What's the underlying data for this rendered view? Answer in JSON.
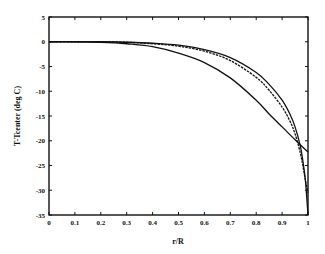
{
  "chart_data": {
    "type": "line",
    "title": "",
    "xlabel": "r/R",
    "ylabel": "T-Tcenter (deg C)",
    "xlim": [
      0,
      1
    ],
    "ylim": [
      -35,
      5
    ],
    "xticks": [
      0,
      0.1,
      0.2,
      0.3,
      0.4,
      0.5,
      0.6,
      0.7,
      0.8,
      0.9,
      1
    ],
    "xtick_labels": [
      "0",
      "0.1",
      "0.2",
      "0.3",
      "0.4",
      "0.5",
      "0.6",
      "0.7",
      "0.8",
      "0.9",
      "1"
    ],
    "yticks": [
      5,
      0,
      -5,
      -10,
      -15,
      -20,
      -25,
      -30,
      -35
    ],
    "ytick_labels": [
      "5",
      "0",
      "-5",
      "-10",
      "-15",
      "-20",
      "-25",
      "-30",
      "-35"
    ],
    "grid": false,
    "legend": null,
    "series": [
      {
        "name": "curve-1-solid-outer",
        "style": "solid",
        "x": [
          0,
          0.1,
          0.2,
          0.3,
          0.4,
          0.5,
          0.6,
          0.7,
          0.8,
          0.85,
          0.9,
          0.93,
          0.95,
          0.97,
          0.98,
          0.99,
          1.0
        ],
        "y": [
          0,
          0,
          0,
          -0.1,
          -0.3,
          -0.7,
          -1.6,
          -3.2,
          -6.2,
          -8.6,
          -11.8,
          -14.6,
          -17.2,
          -21,
          -24,
          -28,
          -35
        ]
      },
      {
        "name": "curve-2-dashed-inner",
        "style": "dashed",
        "x": [
          0,
          0.1,
          0.2,
          0.3,
          0.4,
          0.5,
          0.6,
          0.7,
          0.8,
          0.85,
          0.9,
          0.93,
          0.95,
          0.97,
          0.98,
          0.99,
          1.0
        ],
        "y": [
          0,
          0,
          0,
          -0.1,
          -0.4,
          -0.9,
          -1.9,
          -3.8,
          -7.2,
          -9.8,
          -13.2,
          -16.0,
          -18.6,
          -22.4,
          -25,
          -28,
          -30.5
        ]
      },
      {
        "name": "curve-3-solid-lower",
        "style": "solid",
        "x": [
          0,
          0.1,
          0.2,
          0.25,
          0.3,
          0.4,
          0.5,
          0.6,
          0.7,
          0.8,
          0.85,
          0.9,
          0.95,
          1.0
        ],
        "y": [
          0,
          0,
          -0.1,
          -0.2,
          -0.4,
          -1.0,
          -2.3,
          -4.2,
          -7.3,
          -11.8,
          -14.6,
          -17.2,
          -19.8,
          -22.3
        ]
      }
    ]
  }
}
